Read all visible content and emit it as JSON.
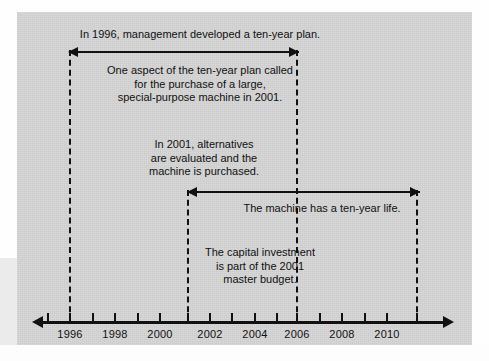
{
  "diagram": {
    "background_color": "#d4d4d4",
    "ink_color": "#111111"
  },
  "axis": {
    "label": "timeline-axis",
    "tick_years": [
      1995,
      1996,
      1997,
      1998,
      1999,
      2000,
      2001,
      2002,
      2003,
      2004,
      2005,
      2006,
      2007,
      2008,
      2009,
      2010,
      2011
    ],
    "labeled_years": [
      {
        "year": "1996",
        "x": 70
      },
      {
        "year": "1998",
        "x": 115
      },
      {
        "year": "2000",
        "x": 160
      },
      {
        "year": "2002",
        "x": 210
      },
      {
        "year": "2004",
        "x": 255
      },
      {
        "year": "2006",
        "x": 297
      },
      {
        "year": "2008",
        "x": 342
      },
      {
        "year": "2010",
        "x": 387
      }
    ],
    "left_arrowhead": "arrow-left",
    "right_arrowhead": "arrow-right"
  },
  "markers": [
    {
      "name": "marker-1996",
      "year": "1996",
      "x": 70
    },
    {
      "name": "marker-2001",
      "year": "2001",
      "x": 188
    },
    {
      "name": "marker-2006",
      "year": "2006",
      "x": 297
    },
    {
      "name": "marker-2011",
      "year": "2011",
      "x": 417
    }
  ],
  "spans": [
    {
      "name": "span-ten-year-plan",
      "from_year": "1996",
      "to_year": "2006",
      "x_start": 70,
      "x_end": 297,
      "y": 52
    },
    {
      "name": "span-machine-life",
      "from_year": "2001",
      "to_year": "2011",
      "x_start": 188,
      "x_end": 417,
      "y": 192
    }
  ],
  "notes": [
    {
      "name": "note-ten-year-plan",
      "text": "In 1996, management developed a ten-year plan."
    },
    {
      "name": "note-one-aspect",
      "text": "One aspect of the ten-year plan called\nfor the purchase of a large,\nspecial-purpose machine in 2001."
    },
    {
      "name": "note-alternatives",
      "text": "In 2001, alternatives\nare evaluated and the\nmachine is purchased."
    },
    {
      "name": "note-machine-life",
      "text": "The machine has a ten-year life."
    },
    {
      "name": "note-capital-investment",
      "text": "The capital investment\nis part of the 2001\nmaster budget."
    }
  ]
}
